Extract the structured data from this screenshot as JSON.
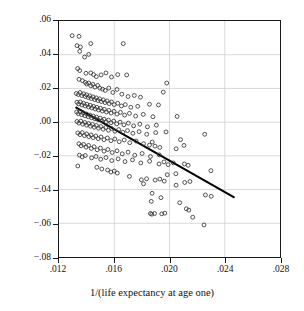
{
  "chart_data": {
    "type": "scatter",
    "title": "",
    "xlabel": "1/(life expectancy at age one)",
    "ylabel": "Growth rate (unexplained part)",
    "xlim": [
      0.012,
      0.028
    ],
    "ylim": [
      -0.08,
      0.06
    ],
    "grid": true,
    "legend": null,
    "xticks": [
      ".012",
      ".016",
      ".020",
      ".024",
      ".028"
    ],
    "xtick_values": [
      0.012,
      0.016,
      0.02,
      0.024,
      0.028
    ],
    "yticks": [
      ".06",
      ".04",
      ".02",
      ".00",
      "−.02",
      "−.04",
      "−.06",
      "−.08"
    ],
    "ytick_values": [
      0.06,
      0.04,
      0.02,
      0.0,
      -0.02,
      -0.04,
      -0.06,
      -0.08
    ],
    "marker": "open-circle",
    "marker_color": "#333333",
    "gridline_color": "#cfcfcf",
    "axis_color": "#1a1a1a",
    "fit_line": {
      "name": "regression-line",
      "color": "#000000",
      "x": [
        0.01325,
        0.02465
      ],
      "y": [
        0.0086,
        -0.0445
      ]
    },
    "points": [
      [
        0.01295,
        0.0513
      ],
      [
        0.01345,
        0.0509
      ],
      [
        0.0133,
        0.0454
      ],
      [
        0.01355,
        0.0446
      ],
      [
        0.0143,
        0.0466
      ],
      [
        0.01665,
        0.0466
      ],
      [
        0.0135,
        0.042
      ],
      [
        0.01385,
        0.0386
      ],
      [
        0.01415,
        0.0402
      ],
      [
        0.01335,
        0.0318
      ],
      [
        0.0135,
        0.0306
      ],
      [
        0.01395,
        0.029
      ],
      [
        0.0143,
        0.0292
      ],
      [
        0.0145,
        0.0282
      ],
      [
        0.0147,
        0.027
      ],
      [
        0.01505,
        0.028
      ],
      [
        0.0154,
        0.0292
      ],
      [
        0.0158,
        0.0268
      ],
      [
        0.01625,
        0.0282
      ],
      [
        0.0169,
        0.028
      ],
      [
        0.0198,
        0.0232
      ],
      [
        0.01955,
        0.0178
      ],
      [
        0.01345,
        0.0254
      ],
      [
        0.0137,
        0.0246
      ],
      [
        0.0139,
        0.0236
      ],
      [
        0.014,
        0.0226
      ],
      [
        0.01415,
        0.0232
      ],
      [
        0.0143,
        0.0216
      ],
      [
        0.01445,
        0.0224
      ],
      [
        0.0146,
        0.0208
      ],
      [
        0.0148,
        0.0218
      ],
      [
        0.01495,
        0.0202
      ],
      [
        0.01515,
        0.0196
      ],
      [
        0.01535,
        0.0188
      ],
      [
        0.0156,
        0.0202
      ],
      [
        0.0159,
        0.0176
      ],
      [
        0.0162,
        0.0194
      ],
      [
        0.01655,
        0.0166
      ],
      [
        0.017,
        0.0152
      ],
      [
        0.01745,
        0.0158
      ],
      [
        0.0179,
        0.0148
      ],
      [
        0.01855,
        0.0106
      ],
      [
        0.0192,
        0.0102
      ],
      [
        0.01325,
        0.017
      ],
      [
        0.0134,
        0.0164
      ],
      [
        0.01352,
        0.0176
      ],
      [
        0.01365,
        0.0158
      ],
      [
        0.01378,
        0.0168
      ],
      [
        0.0139,
        0.0152
      ],
      [
        0.014,
        0.0162
      ],
      [
        0.01412,
        0.0146
      ],
      [
        0.01422,
        0.0156
      ],
      [
        0.01434,
        0.014
      ],
      [
        0.01446,
        0.015
      ],
      [
        0.01458,
        0.0134
      ],
      [
        0.0147,
        0.0144
      ],
      [
        0.01482,
        0.0128
      ],
      [
        0.01494,
        0.0138
      ],
      [
        0.01506,
        0.0122
      ],
      [
        0.0152,
        0.0132
      ],
      [
        0.01534,
        0.0116
      ],
      [
        0.01548,
        0.0126
      ],
      [
        0.01564,
        0.011
      ],
      [
        0.0158,
        0.012
      ],
      [
        0.016,
        0.0104
      ],
      [
        0.01625,
        0.0112
      ],
      [
        0.01652,
        0.0096
      ],
      [
        0.0168,
        0.0104
      ],
      [
        0.0172,
        0.0088
      ],
      [
        0.0177,
        0.0094
      ],
      [
        0.0133,
        0.0118
      ],
      [
        0.01342,
        0.0108
      ],
      [
        0.01354,
        0.012
      ],
      [
        0.01366,
        0.0102
      ],
      [
        0.01378,
        0.0112
      ],
      [
        0.0139,
        0.0096
      ],
      [
        0.01402,
        0.0106
      ],
      [
        0.01414,
        0.009
      ],
      [
        0.01426,
        0.01
      ],
      [
        0.01438,
        0.0084
      ],
      [
        0.0145,
        0.0094
      ],
      [
        0.01462,
        0.0078
      ],
      [
        0.01474,
        0.0088
      ],
      [
        0.01486,
        0.0072
      ],
      [
        0.015,
        0.0082
      ],
      [
        0.01514,
        0.0066
      ],
      [
        0.01528,
        0.0076
      ],
      [
        0.01544,
        0.006
      ],
      [
        0.0156,
        0.007
      ],
      [
        0.01578,
        0.0054
      ],
      [
        0.01598,
        0.0064
      ],
      [
        0.0162,
        0.0048
      ],
      [
        0.01645,
        0.0058
      ],
      [
        0.01675,
        0.0042
      ],
      [
        0.0171,
        0.0052
      ],
      [
        0.01755,
        0.0036
      ],
      [
        0.0181,
        0.0046
      ],
      [
        0.0188,
        0.0032
      ],
      [
        0.02055,
        0.0034
      ],
      [
        0.01328,
        0.006
      ],
      [
        0.0134,
        0.005
      ],
      [
        0.01352,
        0.0062
      ],
      [
        0.01364,
        0.0044
      ],
      [
        0.01376,
        0.0054
      ],
      [
        0.01388,
        0.0038
      ],
      [
        0.014,
        0.0048
      ],
      [
        0.01412,
        0.0032
      ],
      [
        0.01424,
        0.0042
      ],
      [
        0.01436,
        0.0026
      ],
      [
        0.01448,
        0.0036
      ],
      [
        0.0146,
        0.002
      ],
      [
        0.01472,
        0.003
      ],
      [
        0.01484,
        0.0014
      ],
      [
        0.01498,
        0.0024
      ],
      [
        0.01512,
        0.0008
      ],
      [
        0.01526,
        0.0018
      ],
      [
        0.01542,
        0.0002
      ],
      [
        0.01558,
        0.0012
      ],
      [
        0.01576,
        -0.0004
      ],
      [
        0.01596,
        0.0006
      ],
      [
        0.01618,
        -0.001
      ],
      [
        0.01642,
        0.0
      ],
      [
        0.0167,
        -0.0016
      ],
      [
        0.01702,
        -0.0006
      ],
      [
        0.0174,
        -0.0022
      ],
      [
        0.01785,
        -0.0012
      ],
      [
        0.0184,
        -0.0028
      ],
      [
        0.01905,
        -0.0018
      ],
      [
        0.0133,
        0.0004
      ],
      [
        0.01344,
        -0.0006
      ],
      [
        0.01358,
        0.0006
      ],
      [
        0.01372,
        -0.0012
      ],
      [
        0.01386,
        -0.0002
      ],
      [
        0.014,
        -0.0018
      ],
      [
        0.01414,
        -0.0008
      ],
      [
        0.01428,
        -0.0024
      ],
      [
        0.01442,
        -0.0014
      ],
      [
        0.01456,
        -0.003
      ],
      [
        0.0147,
        -0.002
      ],
      [
        0.01486,
        -0.0036
      ],
      [
        0.01502,
        -0.0026
      ],
      [
        0.0152,
        -0.0042
      ],
      [
        0.01538,
        -0.0032
      ],
      [
        0.01558,
        -0.0048
      ],
      [
        0.0158,
        -0.0038
      ],
      [
        0.01605,
        -0.0054
      ],
      [
        0.01632,
        -0.0044
      ],
      [
        0.01662,
        -0.006
      ],
      [
        0.01696,
        -0.005
      ],
      [
        0.01735,
        -0.0066
      ],
      [
        0.0178,
        -0.0056
      ],
      [
        0.01835,
        -0.0072
      ],
      [
        0.019,
        -0.0062
      ],
      [
        0.01975,
        -0.0058
      ],
      [
        0.0208,
        -0.0104
      ],
      [
        0.02255,
        -0.0072
      ],
      [
        0.01336,
        -0.0064
      ],
      [
        0.01352,
        -0.0074
      ],
      [
        0.01368,
        -0.0062
      ],
      [
        0.01384,
        -0.008
      ],
      [
        0.014,
        -0.007
      ],
      [
        0.01416,
        -0.0086
      ],
      [
        0.01432,
        -0.0076
      ],
      [
        0.01448,
        -0.0092
      ],
      [
        0.01466,
        -0.0082
      ],
      [
        0.01484,
        -0.0098
      ],
      [
        0.01504,
        -0.0088
      ],
      [
        0.01526,
        -0.0104
      ],
      [
        0.0155,
        -0.0094
      ],
      [
        0.01576,
        -0.011
      ],
      [
        0.01604,
        -0.01
      ],
      [
        0.01636,
        -0.0116
      ],
      [
        0.01672,
        -0.0106
      ],
      [
        0.01712,
        -0.0122
      ],
      [
        0.01758,
        -0.0112
      ],
      [
        0.01812,
        -0.0128
      ],
      [
        0.01875,
        -0.0118
      ],
      [
        0.01855,
        -0.0136
      ],
      [
        0.01895,
        -0.0142
      ],
      [
        0.0193,
        -0.015
      ],
      [
        0.02048,
        -0.0158
      ],
      [
        0.02105,
        -0.0138
      ],
      [
        0.01344,
        -0.0128
      ],
      [
        0.0136,
        -0.014
      ],
      [
        0.01378,
        -0.0132
      ],
      [
        0.01396,
        -0.0148
      ],
      [
        0.01414,
        -0.0138
      ],
      [
        0.01434,
        -0.0156
      ],
      [
        0.01454,
        -0.0146
      ],
      [
        0.01476,
        -0.0164
      ],
      [
        0.015,
        -0.0154
      ],
      [
        0.01526,
        -0.0172
      ],
      [
        0.01554,
        -0.0162
      ],
      [
        0.01585,
        -0.018
      ],
      [
        0.0162,
        -0.017
      ],
      [
        0.01658,
        -0.0188
      ],
      [
        0.017,
        -0.0178
      ],
      [
        0.01748,
        -0.0196
      ],
      [
        0.01802,
        -0.0186
      ],
      [
        0.01862,
        -0.0204
      ],
      [
        0.01926,
        -0.0194
      ],
      [
        0.01348,
        -0.0196
      ],
      [
        0.01368,
        -0.0206
      ],
      [
        0.0139,
        -0.0198
      ],
      [
        0.01436,
        -0.0212
      ],
      [
        0.01468,
        -0.0204
      ],
      [
        0.01502,
        -0.022
      ],
      [
        0.0154,
        -0.021
      ],
      [
        0.01582,
        -0.0228
      ],
      [
        0.01628,
        -0.0218
      ],
      [
        0.01678,
        -0.0234
      ],
      [
        0.01732,
        -0.0224
      ],
      [
        0.01792,
        -0.0242
      ],
      [
        0.01856,
        -0.0232
      ],
      [
        0.01924,
        -0.0248
      ],
      [
        0.0196,
        -0.0236
      ],
      [
        0.0199,
        -0.0252
      ],
      [
        0.02028,
        -0.0242
      ],
      [
        0.02108,
        -0.0248
      ],
      [
        0.02135,
        -0.0256
      ],
      [
        0.023,
        -0.0288
      ],
      [
        0.01336,
        -0.026
      ],
      [
        0.01474,
        -0.0268
      ],
      [
        0.0151,
        -0.0278
      ],
      [
        0.01552,
        -0.0284
      ],
      [
        0.01576,
        -0.0296
      ],
      [
        0.016,
        -0.029
      ],
      [
        0.01622,
        -0.0302
      ],
      [
        0.0171,
        -0.0322
      ],
      [
        0.01984,
        -0.0312
      ],
      [
        0.02046,
        -0.0306
      ],
      [
        0.01796,
        -0.0342
      ],
      [
        0.01834,
        -0.0336
      ],
      [
        0.01896,
        -0.0344
      ],
      [
        0.0193,
        -0.0338
      ],
      [
        0.01962,
        -0.035
      ],
      [
        0.0211,
        -0.0358
      ],
      [
        0.02148,
        -0.0352
      ],
      [
        0.02048,
        -0.0374
      ],
      [
        0.01812,
        -0.0366
      ],
      [
        0.01874,
        -0.0422
      ],
      [
        0.01938,
        -0.0448
      ],
      [
        0.01868,
        -0.047
      ],
      [
        0.02074,
        -0.0478
      ],
      [
        0.0226,
        -0.0432
      ],
      [
        0.02302,
        -0.044
      ],
      [
        0.02122,
        -0.0514
      ],
      [
        0.0214,
        -0.0522
      ],
      [
        0.01862,
        -0.0542
      ],
      [
        0.01872,
        -0.0546
      ],
      [
        0.01892,
        -0.0542
      ],
      [
        0.01944,
        -0.0544
      ],
      [
        0.01966,
        -0.054
      ],
      [
        0.02168,
        -0.0564
      ],
      [
        0.0225,
        -0.061
      ]
    ]
  }
}
